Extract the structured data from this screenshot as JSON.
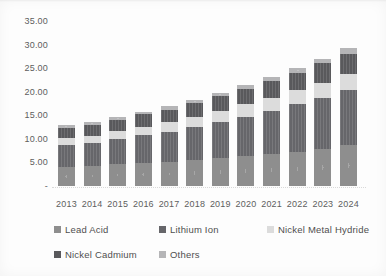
{
  "chart_data": {
    "type": "bar",
    "stacked": true,
    "title": "",
    "xlabel": "",
    "ylabel": "",
    "categories": [
      "2013",
      "2014",
      "2015",
      "2016",
      "2017",
      "2018",
      "2019",
      "2020",
      "2021",
      "2022",
      "2023",
      "2024"
    ],
    "series": [
      {
        "name": "Lead Acid",
        "color": "#8e8e8e",
        "texture": "dots",
        "values": [
          4.0,
          4.2,
          4.6,
          4.9,
          5.2,
          5.5,
          6.0,
          6.3,
          6.8,
          7.3,
          7.8,
          8.6
        ]
      },
      {
        "name": "Lithium Ion",
        "color": "#66666a",
        "texture": "lines",
        "values": [
          4.7,
          4.9,
          5.3,
          5.9,
          6.3,
          7.0,
          7.6,
          8.4,
          9.2,
          10.0,
          10.9,
          11.8
        ]
      },
      {
        "name": "Nickel Metal Hydride",
        "color": "#dcdcdc",
        "texture": "none",
        "values": [
          1.5,
          1.6,
          1.7,
          1.8,
          2.0,
          2.1,
          2.3,
          2.6,
          2.7,
          3.0,
          3.2,
          3.4
        ]
      },
      {
        "name": "Nickel Cadmium",
        "color": "#59595c",
        "texture": "lines",
        "values": [
          2.2,
          2.3,
          2.4,
          2.6,
          2.7,
          3.0,
          3.1,
          3.3,
          3.6,
          3.7,
          4.1,
          4.3
        ]
      },
      {
        "name": "Others",
        "color": "#b5b5b7",
        "texture": "dots",
        "values": [
          0.5,
          0.5,
          0.6,
          0.6,
          0.7,
          0.7,
          0.8,
          0.8,
          0.9,
          1.0,
          1.0,
          1.1
        ]
      }
    ],
    "ylim": [
      0,
      35
    ],
    "y_ticks": [
      {
        "value": 35,
        "label": "35.00"
      },
      {
        "value": 30,
        "label": "30.00"
      },
      {
        "value": 25,
        "label": "25.00"
      },
      {
        "value": 20,
        "label": "20.00"
      },
      {
        "value": 15,
        "label": "15.00"
      },
      {
        "value": 10,
        "label": "10.00"
      },
      {
        "value": 5,
        "label": "5.00"
      },
      {
        "value": 0,
        "label": "-"
      }
    ],
    "grid": false,
    "legend_position": "bottom",
    "axis_text_color": "#5d5d5d"
  }
}
